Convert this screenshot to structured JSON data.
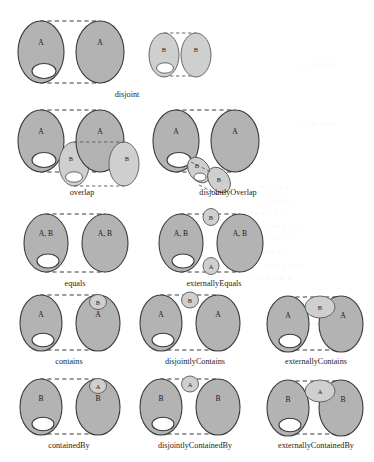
{
  "figure": {
    "title_visible": false,
    "background": "#ffffff",
    "colors": {
      "region_a_fill": "#b3b3b3",
      "region_b_fill": "#cfcfcf",
      "outline": "#3c3c3c",
      "hole_fill": "#ffffff",
      "dashed_connector": "#3c3c3c",
      "caption_color": "#1d1d1d"
    },
    "bleed_through_note": "faint reversed text from the opposite page, illegible",
    "bleed_lines": [
      "a  cn  r  e     v   b",
      "n t  l  ei    sf  o",
      "t  o  n  e    a  cr",
      "e s  ui   n  t o",
      "a  l  e  s   i  r  n",
      "c  o  m  e    d  t",
      "n  e  a   s  o  l  v",
      "r  i  t  e  n    m  a"
    ]
  },
  "diagrams": [
    {
      "id": "disjoint",
      "caption": "disjoint",
      "regions": [
        "A",
        "A",
        "B",
        "B"
      ],
      "left_labels": [
        "A",
        "A"
      ],
      "right_labels": [
        "B",
        "B"
      ],
      "has_hole": true
    },
    {
      "id": "overlap",
      "caption": "overlap",
      "regions": [
        "A",
        "A",
        "B",
        "B"
      ],
      "left_labels": [
        "A",
        "A"
      ],
      "right_labels": [
        "B",
        "B"
      ],
      "has_hole": true
    },
    {
      "id": "disjointlyOverlap",
      "caption": "disjointlyOverlap",
      "regions": [
        "A",
        "A",
        "B",
        "B"
      ],
      "left_labels": [
        "A",
        "A"
      ],
      "right_labels": [
        "B",
        "B"
      ],
      "has_hole": true
    },
    {
      "id": "equals",
      "caption": "equals",
      "regions": [
        "A, B",
        "A, B"
      ],
      "labels": [
        "A, B",
        "A, B"
      ],
      "has_hole": true
    },
    {
      "id": "externallyEquals",
      "caption": "externallyEquals",
      "regions": [
        "A, B",
        "A, B",
        "B",
        "A"
      ],
      "labels": [
        "A, B",
        "A, B"
      ],
      "satellite_top": "B",
      "satellite_bottom": "A",
      "has_hole": true
    },
    {
      "id": "contains",
      "caption": "contains",
      "regions": [
        "A",
        "A",
        "B"
      ],
      "labels": [
        "A",
        "A"
      ],
      "satellite": "B",
      "has_hole": true
    },
    {
      "id": "disjointlyContains",
      "caption": "disjointlyContains",
      "regions": [
        "A",
        "A",
        "B"
      ],
      "labels": [
        "A",
        "A"
      ],
      "satellite": "B",
      "has_hole": true
    },
    {
      "id": "externallyContains",
      "caption": "externallyContains",
      "regions": [
        "A",
        "A",
        "B"
      ],
      "labels": [
        "A",
        "A"
      ],
      "satellite": "B",
      "has_hole": true
    },
    {
      "id": "containedBy",
      "caption": "containedBy",
      "regions": [
        "B",
        "B",
        "A"
      ],
      "labels": [
        "B",
        "B"
      ],
      "satellite": "A",
      "has_hole": true
    },
    {
      "id": "disjointlyContainedBy",
      "caption": "disjointlyContainedBy",
      "regions": [
        "B",
        "B",
        "A"
      ],
      "labels": [
        "B",
        "B"
      ],
      "satellite": "A",
      "has_hole": true
    },
    {
      "id": "externallyContainedBy",
      "caption": "externallyContainedBy",
      "regions": [
        "B",
        "B",
        "A"
      ],
      "labels": [
        "B",
        "B"
      ],
      "satellite": "A",
      "has_hole": true
    }
  ],
  "captions": {
    "disjoint": "disjoint",
    "overlap": "overlap",
    "disjointlyOverlap": "disjointlyOverlap",
    "equals": "equals",
    "externallyEquals": "externallyEquals",
    "contains": "contains",
    "disjointlyContains": "disjointlyContains",
    "externallyContains": "externallyContains",
    "containedBy": "containedBy",
    "disjointlyContainedBy": "disjointlyContainedBy",
    "externallyContainedBy": "externallyContainedBy"
  },
  "region_labels": {
    "a": "A",
    "b": "B",
    "ab": "A, B"
  }
}
